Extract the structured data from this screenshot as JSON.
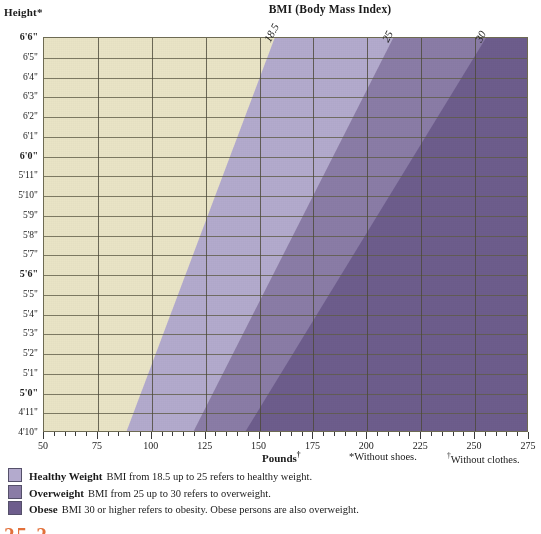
{
  "titles": {
    "height_axis": "Height*",
    "chart": "BMI (Body Mass Index)",
    "pounds_axis": "Pounds",
    "pounds_dagger": "†"
  },
  "footnotes": {
    "shoes": "*Without shoes.",
    "clothes_dagger": "†",
    "clothes": "Without clothes."
  },
  "page_label": "25.2",
  "colors": {
    "underweight": "#e9e4c6",
    "healthy": "#b3aacd",
    "overweight": "#8a7ca6",
    "obese": "#6d5d8c",
    "grid": "#5f5c47",
    "accent": "#e2703a"
  },
  "legend": [
    {
      "swatch": "#b3aacd",
      "name": "Healthy Weight",
      "desc": "BMI from 18.5 up to 25 refers to healthy weight."
    },
    {
      "swatch": "#8a7ca6",
      "name": "Overweight",
      "desc": "BMI from 25 up to 30 refers to overweight."
    },
    {
      "swatch": "#6d5d8c",
      "name": "Obese",
      "desc": "BMI 30 or higher refers to obesity. Obese persons are also overweight."
    }
  ],
  "chart_data": {
    "type": "area",
    "title": "BMI (Body Mass Index)",
    "xlabel": "Pounds",
    "ylabel": "Height",
    "xlim": [
      50,
      275
    ],
    "ylim_inches": [
      58,
      78
    ],
    "grid": true,
    "legend_position": "below-plot",
    "x_ticks": [
      50,
      75,
      100,
      125,
      150,
      175,
      200,
      225,
      250,
      275
    ],
    "x_minor_tick_step": 5,
    "y_ticks": [
      {
        "label": "6'6\"",
        "inches": 78,
        "bold": true
      },
      {
        "label": "6'5\"",
        "inches": 77,
        "bold": false
      },
      {
        "label": "6'4\"",
        "inches": 76,
        "bold": false
      },
      {
        "label": "6'3\"",
        "inches": 75,
        "bold": false
      },
      {
        "label": "6'2\"",
        "inches": 74,
        "bold": false
      },
      {
        "label": "6'1\"",
        "inches": 73,
        "bold": false
      },
      {
        "label": "6'0\"",
        "inches": 72,
        "bold": true
      },
      {
        "label": "5'11\"",
        "inches": 71,
        "bold": false
      },
      {
        "label": "5'10\"",
        "inches": 70,
        "bold": false
      },
      {
        "label": "5'9\"",
        "inches": 69,
        "bold": false
      },
      {
        "label": "5'8\"",
        "inches": 68,
        "bold": false
      },
      {
        "label": "5'7\"",
        "inches": 67,
        "bold": false
      },
      {
        "label": "5'6\"",
        "inches": 66,
        "bold": true
      },
      {
        "label": "5'5\"",
        "inches": 65,
        "bold": false
      },
      {
        "label": "5'4\"",
        "inches": 64,
        "bold": false
      },
      {
        "label": "5'3\"",
        "inches": 63,
        "bold": false
      },
      {
        "label": "5'2\"",
        "inches": 62,
        "bold": false
      },
      {
        "label": "5'1\"",
        "inches": 61,
        "bold": false
      },
      {
        "label": "5'0\"",
        "inches": 60,
        "bold": true
      },
      {
        "label": "4'11\"",
        "inches": 59,
        "bold": false
      },
      {
        "label": "4'10\"",
        "inches": 58,
        "bold": false
      }
    ],
    "boundaries": [
      {
        "bmi": 18.5,
        "label": "18.5",
        "lbs_at_4ft10": 88,
        "lbs_at_6ft6": 157
      },
      {
        "bmi": 25,
        "label": "25",
        "lbs_at_4ft10": 119,
        "lbs_at_6ft6": 212
      },
      {
        "bmi": 30,
        "label": "30",
        "lbs_at_4ft10": 143,
        "lbs_at_6ft6": 255
      }
    ],
    "regions": [
      {
        "name": "Underweight",
        "range": "BMI below 18.5",
        "color": "#e9e4c6"
      },
      {
        "name": "Healthy Weight",
        "range": "BMI 18.5 up to 25",
        "color": "#b3aacd"
      },
      {
        "name": "Overweight",
        "range": "BMI 25 up to 30",
        "color": "#8a7ca6"
      },
      {
        "name": "Obese",
        "range": "BMI 30 or higher",
        "color": "#6d5d8c"
      }
    ]
  }
}
